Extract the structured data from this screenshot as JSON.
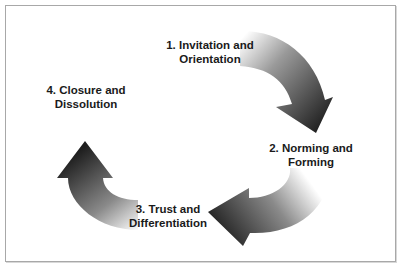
{
  "diagram": {
    "type": "cycle",
    "stages": [
      {
        "number": 1,
        "line1": "1. Invitation and",
        "line2": "Orientation"
      },
      {
        "number": 2,
        "line1": "2. Norming and",
        "line2": "Forming"
      },
      {
        "number": 3,
        "line1": "3. Trust and",
        "line2": "Differentiation"
      },
      {
        "number": 4,
        "line1": "4. Closure and",
        "line2": "Dissolution"
      }
    ],
    "colors": {
      "arrow_dark": "#1e1e1e",
      "arrow_light": "#ffffff",
      "frame_border": "#a8a8a8",
      "text": "#1a1a1a"
    }
  }
}
